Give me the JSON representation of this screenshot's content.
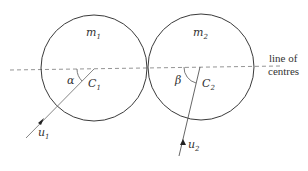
{
  "diagram": {
    "type": "collision of two spheres",
    "spheres": [
      {
        "mass_label": "m",
        "mass_sub": "1",
        "centre_label": "C",
        "centre_sub": "1",
        "angle_label": "α",
        "velocity_label": "u",
        "velocity_sub": "1",
        "cx": 94,
        "cy": 69,
        "r": 53
      },
      {
        "mass_label": "m",
        "mass_sub": "2",
        "centre_label": "C",
        "centre_sub": "2",
        "angle_label": "β",
        "velocity_label": "u",
        "velocity_sub": "2",
        "cx": 200,
        "cy": 68,
        "r": 53
      }
    ],
    "line_of_centres": {
      "line1": "line of",
      "line2": "centres"
    },
    "colors": {
      "stroke": "#3a3a3a",
      "dash": "#888888",
      "text": "#333333"
    }
  }
}
